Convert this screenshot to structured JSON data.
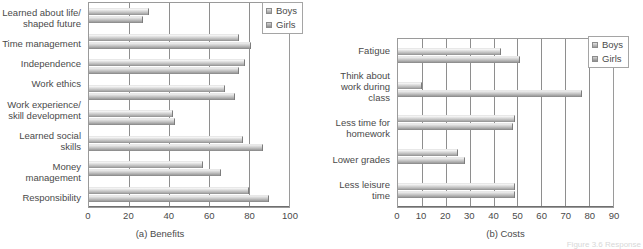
{
  "figure": {
    "credit": "Figure 3.6    Response"
  },
  "legend": {
    "boys": "Boys",
    "girls": "Girls"
  },
  "chart_data": [
    {
      "type": "bar",
      "orientation": "horizontal",
      "title": "",
      "subcaption": "(a) Benefits",
      "xlabel": "",
      "ylabel": "",
      "xlim": [
        0,
        100
      ],
      "xticks": [
        0,
        20,
        40,
        60,
        80,
        100
      ],
      "grid": true,
      "legend_position": "top-right",
      "categories": [
        "Learned about life/ shaped future",
        "Time management",
        "Independence",
        "Work ethics",
        "Work experience/ skill development",
        "Learned social skills",
        "Money management",
        "Responsibility"
      ],
      "series": [
        {
          "name": "Boys",
          "values": [
            30,
            75,
            78,
            68,
            42,
            77,
            57,
            80
          ]
        },
        {
          "name": "Girls",
          "values": [
            27,
            81,
            75,
            73,
            43,
            87,
            66,
            90
          ]
        }
      ]
    },
    {
      "type": "bar",
      "orientation": "horizontal",
      "title": "",
      "subcaption": "(b) Costs",
      "xlabel": "",
      "ylabel": "",
      "xlim": [
        0,
        90
      ],
      "xticks": [
        0,
        10,
        20,
        30,
        40,
        50,
        60,
        70,
        80,
        90
      ],
      "grid": true,
      "legend_position": "top-right",
      "categories": [
        "Fatigue",
        "Think about work during class",
        "Less time for homework",
        "Lower grades",
        "Less leisure time"
      ],
      "series": [
        {
          "name": "Boys",
          "values": [
            43,
            10,
            49,
            25,
            49
          ]
        },
        {
          "name": "Girls",
          "values": [
            51,
            77,
            48,
            28,
            49
          ]
        }
      ]
    }
  ]
}
